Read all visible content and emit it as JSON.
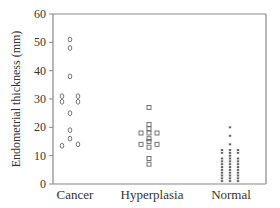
{
  "chart_data": {
    "type": "scatter",
    "title": "",
    "xlabel": "",
    "ylabel": "Endometrial thickness (mm)",
    "ylim": [
      0,
      60
    ],
    "yticks": [
      0,
      10,
      20,
      30,
      40,
      50,
      60
    ],
    "categories": [
      "Cancer",
      "Hyperplasia",
      "Normal"
    ],
    "grid": false,
    "legend": null,
    "series": [
      {
        "name": "Cancer",
        "marker": "diamond-open",
        "points": [
          {
            "offset": 0,
            "value": 51
          },
          {
            "offset": 0,
            "value": 48
          },
          {
            "offset": 0,
            "value": 38
          },
          {
            "offset": -1,
            "value": 31
          },
          {
            "offset": 1,
            "value": 31
          },
          {
            "offset": -1,
            "value": 29
          },
          {
            "offset": 1,
            "value": 29
          },
          {
            "offset": 0,
            "value": 25
          },
          {
            "offset": 0,
            "value": 19
          },
          {
            "offset": 0,
            "value": 16
          },
          {
            "offset": -1,
            "value": 13.5
          },
          {
            "offset": 1,
            "value": 14
          }
        ]
      },
      {
        "name": "Hyperplasia",
        "marker": "square-open",
        "points": [
          {
            "offset": 0,
            "value": 27
          },
          {
            "offset": 0,
            "value": 21
          },
          {
            "offset": 0,
            "value": 19.5
          },
          {
            "offset": -1,
            "value": 18
          },
          {
            "offset": 0,
            "value": 18
          },
          {
            "offset": 1,
            "value": 18
          },
          {
            "offset": 0,
            "value": 16
          },
          {
            "offset": 0,
            "value": 15
          },
          {
            "offset": -1,
            "value": 14
          },
          {
            "offset": 1,
            "value": 14
          },
          {
            "offset": 0,
            "value": 13
          },
          {
            "offset": 0,
            "value": 9
          },
          {
            "offset": 0,
            "value": 7
          }
        ]
      },
      {
        "name": "Normal",
        "marker": "dot",
        "points": [
          {
            "offset": 0,
            "value": 20
          },
          {
            "offset": 0,
            "value": 17
          },
          {
            "offset": 0,
            "value": 14
          },
          {
            "offset": 0,
            "value": 12
          },
          {
            "offset": 0,
            "value": 11
          },
          {
            "offset": 0,
            "value": 10
          },
          {
            "offset": 0,
            "value": 9
          },
          {
            "offset": 0,
            "value": 8
          },
          {
            "offset": 0,
            "value": 7
          },
          {
            "offset": 0,
            "value": 6
          },
          {
            "offset": 0,
            "value": 5
          },
          {
            "offset": 0,
            "value": 4
          },
          {
            "offset": 0,
            "value": 3
          },
          {
            "offset": 0,
            "value": 2
          },
          {
            "offset": 0,
            "value": 1
          },
          {
            "offset": -1,
            "value": 12
          },
          {
            "offset": -1,
            "value": 11
          },
          {
            "offset": -1,
            "value": 9
          },
          {
            "offset": -1,
            "value": 8
          },
          {
            "offset": -1,
            "value": 7
          },
          {
            "offset": -1,
            "value": 6
          },
          {
            "offset": -1,
            "value": 5
          },
          {
            "offset": -1,
            "value": 4
          },
          {
            "offset": -1,
            "value": 3
          },
          {
            "offset": -1,
            "value": 2
          },
          {
            "offset": -1,
            "value": 1
          },
          {
            "offset": 1,
            "value": 12
          },
          {
            "offset": 1,
            "value": 11
          },
          {
            "offset": 1,
            "value": 9
          },
          {
            "offset": 1,
            "value": 8
          },
          {
            "offset": 1,
            "value": 7
          },
          {
            "offset": 1,
            "value": 6
          },
          {
            "offset": 1,
            "value": 5
          },
          {
            "offset": 1,
            "value": 4
          },
          {
            "offset": 1,
            "value": 3
          },
          {
            "offset": 1,
            "value": 2
          },
          {
            "offset": 1,
            "value": 1
          }
        ]
      }
    ]
  },
  "colors": {
    "axis": "#888888",
    "marker": "#666666",
    "text": "#333333"
  }
}
